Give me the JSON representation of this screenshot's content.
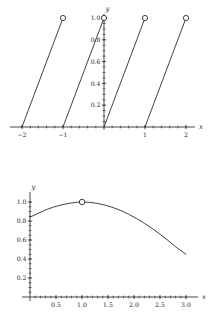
{
  "page": {
    "background_color": "#ffffff",
    "ink_color": "#1a1a1a"
  },
  "chart_data": [
    {
      "id": "sawtooth-fractional-part",
      "type": "line",
      "title": "",
      "subtitle": "",
      "xlabel": "x",
      "ylabel": "y",
      "xlim": [
        -2.35,
        2.35
      ],
      "ylim": [
        0,
        1.12
      ],
      "grid": false,
      "legend": null,
      "x_ticks": [
        -2,
        -1,
        0,
        1,
        2
      ],
      "x_tick_labels": [
        "−2",
        "−1",
        "",
        "1",
        "2"
      ],
      "y_ticks": [
        0.2,
        0.4,
        0.6,
        0.8,
        1.0
      ],
      "y_tick_labels": [
        "0.2",
        "0.4",
        "0.6",
        "0.8",
        "1.0"
      ],
      "x_minor_tick_step": 0.2,
      "y_minor_tick_step": 0.05,
      "segments": [
        {
          "x_start": -2,
          "y_start": 0,
          "x_end": -1,
          "y_end": 1
        },
        {
          "x_start": -1,
          "y_start": 0,
          "x_end": 0,
          "y_end": 1
        },
        {
          "x_start": 0,
          "y_start": 0,
          "x_end": 1,
          "y_end": 1
        },
        {
          "x_start": 1,
          "y_start": 0,
          "x_end": 2,
          "y_end": 1
        }
      ],
      "open_points": [
        {
          "x": -1,
          "y": 1
        },
        {
          "x": 0,
          "y": 1
        },
        {
          "x": 1,
          "y": 1
        },
        {
          "x": 2,
          "y": 1
        }
      ],
      "description": "Sawtooth wave: four rising unit segments with open circles at the top of each"
    },
    {
      "id": "smooth-peak-curve",
      "type": "line",
      "title": "",
      "subtitle": "",
      "xlabel": "x",
      "ylabel": "y",
      "xlim": [
        0,
        3.25
      ],
      "ylim": [
        0,
        1.1
      ],
      "grid": false,
      "legend": null,
      "x_ticks": [
        0.5,
        1.0,
        1.5,
        2.0,
        2.5,
        3.0
      ],
      "x_tick_labels": [
        "0.5",
        "1.0",
        "1.5",
        "2.0",
        "2.5",
        "3.0"
      ],
      "y_ticks": [
        0.2,
        0.4,
        0.6,
        0.8,
        1.0
      ],
      "y_tick_labels": [
        "0.2",
        "0.4",
        "0.6",
        "0.8",
        "1.0"
      ],
      "x_minor_tick_step": 0.1,
      "y_minor_tick_step": 0.05,
      "x": [
        0.0,
        0.15,
        0.3,
        0.45,
        0.6,
        0.75,
        0.9,
        1.0,
        1.15,
        1.3,
        1.45,
        1.6,
        1.75,
        1.9,
        2.05,
        2.2,
        2.35,
        2.5,
        2.65,
        2.8,
        3.0
      ],
      "values": [
        0.84,
        0.88,
        0.916,
        0.946,
        0.969,
        0.986,
        0.997,
        1.0,
        0.996,
        0.985,
        0.966,
        0.941,
        0.909,
        0.87,
        0.826,
        0.776,
        0.721,
        0.661,
        0.597,
        0.529,
        0.45
      ],
      "open_points": [
        {
          "x": 1.0,
          "y": 1.0
        }
      ],
      "description": "Smooth concave curve rising from 0.84 at x=0 to a maximum of 1.0 at x=1.0 (marked with an open circle), then falling to about 0.45 at x=3.0"
    }
  ]
}
